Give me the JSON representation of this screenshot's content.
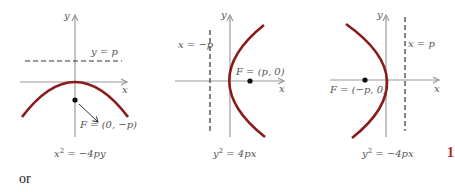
{
  "colors": {
    "curve": "#8b1a1a",
    "axis": "#9a9a9a",
    "directrix": "#333333",
    "focus": "#111111",
    "label": "#555555",
    "page_number": "#b3262a"
  },
  "diagrams": [
    {
      "id": "down",
      "x_axis_label": "x",
      "y_axis_label": "y",
      "directrix_label": "y = p",
      "focus_label": "F = (0, −p)",
      "equation": {
        "base1": "x",
        "sup": "2",
        "rest": " = −4py"
      },
      "opens": "down"
    },
    {
      "id": "right",
      "x_axis_label": "x",
      "y_axis_label": "y",
      "directrix_label": "x = −p",
      "focus_label": "F = (p, 0)",
      "equation": {
        "base1": "y",
        "sup": "2",
        "rest": " = 4px"
      },
      "opens": "right"
    },
    {
      "id": "left",
      "x_axis_label": "x",
      "y_axis_label": "y",
      "directrix_label": "x = p",
      "focus_label": "F = (−p, 0)",
      "equation": {
        "base1": "y",
        "sup": "2",
        "rest": " = −4px"
      },
      "opens": "left"
    }
  ],
  "footer": {
    "or_text": "or",
    "page_marker": "1"
  }
}
